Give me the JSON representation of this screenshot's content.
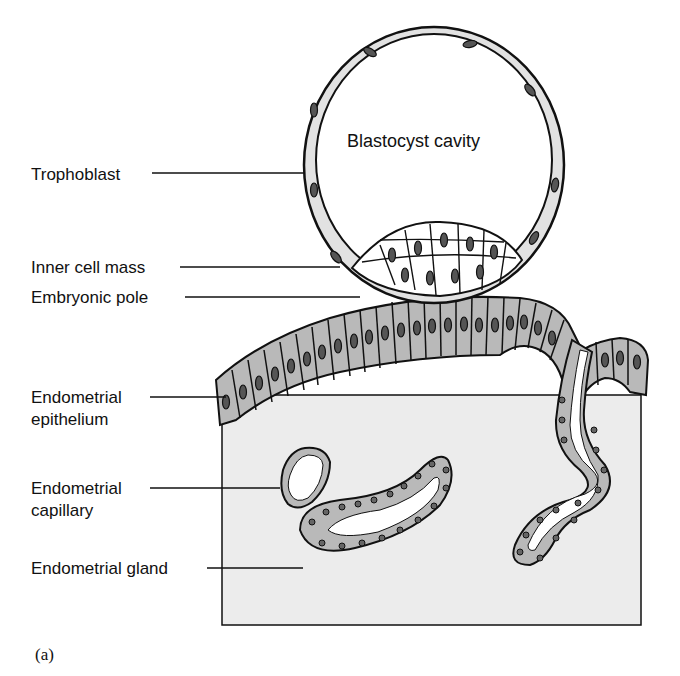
{
  "figure": {
    "panel_label": "(a)",
    "cavity_label": "Blastocyst cavity",
    "labels": [
      {
        "id": "trophoblast",
        "text": "Trophoblast"
      },
      {
        "id": "inner-cell-mass",
        "text": "Inner cell mass"
      },
      {
        "id": "embryonic-pole",
        "text": "Embryonic pole"
      },
      {
        "id": "endometrial-epithelium",
        "line1": "Endometrial",
        "line2": "epithelium"
      },
      {
        "id": "endometrial-capillary",
        "line1": "Endometrial",
        "line2": "capillary"
      },
      {
        "id": "endometrial-gland",
        "text": "Endometrial gland"
      }
    ],
    "colors": {
      "cell_fill": "#b9b9b9",
      "tissue_fill": "#ececec",
      "trophoblast_fill": "#e2e2e2",
      "outline": "#111111"
    }
  }
}
